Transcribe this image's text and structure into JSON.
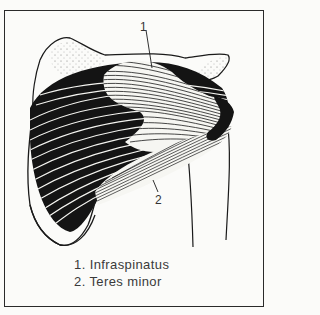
{
  "figure": {
    "callouts": [
      {
        "number": "1",
        "target": "Infraspinatus"
      },
      {
        "number": "2",
        "target": "Teres minor"
      }
    ]
  },
  "labels": {
    "callout_1": "1",
    "callout_2": "2"
  },
  "legend": {
    "items": [
      {
        "text": "1.  Infraspinatus"
      },
      {
        "text": "2.  Teres minor"
      }
    ]
  },
  "colors": {
    "ink": "#1a1a1a",
    "paper": "#fbfbf9",
    "frame": "#2a2a2a"
  }
}
